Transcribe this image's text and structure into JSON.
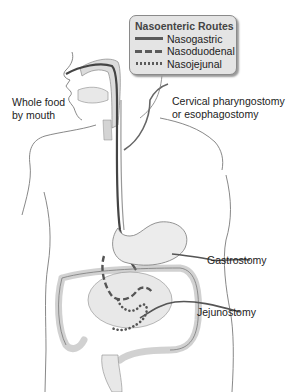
{
  "legend": {
    "title": "Nasoenteric Routes",
    "items": [
      {
        "label": "Nasogastric",
        "style": "solid"
      },
      {
        "label": "Nasoduodenal",
        "style": "dashed"
      },
      {
        "label": "Nasojejunal",
        "style": "dotted"
      }
    ]
  },
  "labels": {
    "whole_food_line1": "Whole food",
    "whole_food_line2": "by mouth",
    "cervical_line1": "Cervical pharyngostomy",
    "cervical_line2": "or esophagostomy",
    "gastrostomy": "Gastrostomy",
    "jejunostomy": "Jejunostomy"
  },
  "colors": {
    "outline": "#6a6a6a",
    "tube": "#555555",
    "organ_fill": "#e6e6e6",
    "legend_bg": "#e4e4e4"
  }
}
